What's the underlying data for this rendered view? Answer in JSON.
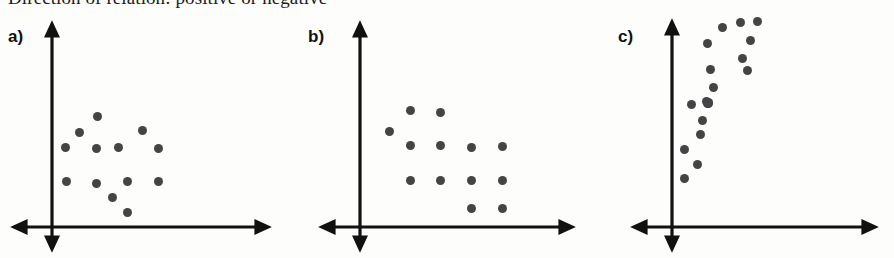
{
  "heading": {
    "text": "Direction of relation: positive or negative"
  },
  "figure": {
    "background_color": "#fdfdfc",
    "axis_color": "#111111",
    "dot_color": "#434445"
  },
  "panels": [
    {
      "id": "panel-a",
      "label": "a)",
      "relation": "no relation / random scatter",
      "origin_x": 52,
      "origin_y": 227,
      "x_axis_end": 268,
      "y_axis_top": 24,
      "points": [
        {
          "x": 97,
          "y": 116
        },
        {
          "x": 79,
          "y": 132
        },
        {
          "x": 142,
          "y": 130
        },
        {
          "x": 65,
          "y": 147
        },
        {
          "x": 96,
          "y": 148
        },
        {
          "x": 118,
          "y": 147
        },
        {
          "x": 158,
          "y": 148
        },
        {
          "x": 66,
          "y": 181
        },
        {
          "x": 96,
          "y": 183
        },
        {
          "x": 127,
          "y": 181
        },
        {
          "x": 158,
          "y": 181
        },
        {
          "x": 112,
          "y": 197
        },
        {
          "x": 127,
          "y": 212
        }
      ]
    },
    {
      "id": "panel-b",
      "label": "b)",
      "relation": "negative relation",
      "origin_x": 360,
      "origin_y": 227,
      "x_axis_end": 572,
      "y_axis_top": 24,
      "points": [
        {
          "x": 410,
          "y": 110
        },
        {
          "x": 440,
          "y": 112
        },
        {
          "x": 389,
          "y": 131
        },
        {
          "x": 410,
          "y": 145
        },
        {
          "x": 440,
          "y": 145
        },
        {
          "x": 471,
          "y": 147
        },
        {
          "x": 502,
          "y": 146
        },
        {
          "x": 410,
          "y": 180
        },
        {
          "x": 440,
          "y": 180
        },
        {
          "x": 471,
          "y": 180
        },
        {
          "x": 502,
          "y": 180
        },
        {
          "x": 471,
          "y": 208
        },
        {
          "x": 502,
          "y": 208
        }
      ]
    },
    {
      "id": "panel-c",
      "label": "c)",
      "relation": "positive relation",
      "origin_x": 672,
      "origin_y": 227,
      "x_axis_end": 875,
      "y_axis_top": 22,
      "points": [
        {
          "x": 740,
          "y": 22
        },
        {
          "x": 757,
          "y": 21
        },
        {
          "x": 722,
          "y": 27
        },
        {
          "x": 750,
          "y": 40
        },
        {
          "x": 707,
          "y": 43
        },
        {
          "x": 742,
          "y": 58
        },
        {
          "x": 710,
          "y": 69
        },
        {
          "x": 747,
          "y": 70
        },
        {
          "x": 713,
          "y": 87
        },
        {
          "x": 706,
          "y": 101
        },
        {
          "x": 708,
          "y": 102
        },
        {
          "x": 708,
          "y": 103
        },
        {
          "x": 707,
          "y": 103
        },
        {
          "x": 691,
          "y": 104
        },
        {
          "x": 702,
          "y": 120
        },
        {
          "x": 700,
          "y": 134
        },
        {
          "x": 684,
          "y": 149
        },
        {
          "x": 697,
          "y": 164
        },
        {
          "x": 684,
          "y": 178
        }
      ]
    }
  ]
}
